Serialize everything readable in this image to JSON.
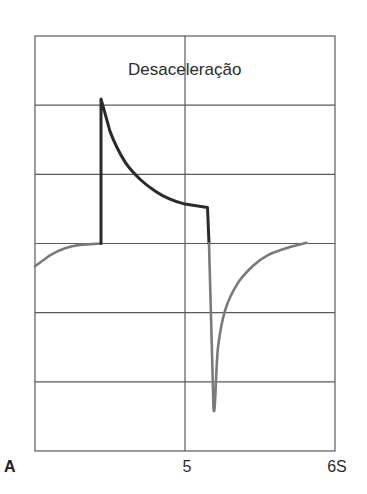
{
  "chart_data": {
    "type": "line",
    "title": "Desaceleração",
    "panel_label": "A",
    "xlabel": "",
    "ylabel": "",
    "x_unit": "S",
    "xlim": [
      4,
      6
    ],
    "x_ticks": [
      {
        "value": 5,
        "label": "5"
      },
      {
        "value": 6,
        "label": "6S"
      }
    ],
    "ylim": [
      -3,
      3
    ],
    "y_ticks": [],
    "grid": true,
    "grid_rows": 6,
    "grid_cols": 2,
    "baseline": 0,
    "series": [
      {
        "name": "pre-baseline (gray)",
        "color": "#7a7a7a",
        "points": [
          [
            4.0,
            -0.33
          ],
          [
            4.1,
            -0.17
          ],
          [
            4.2,
            -0.07
          ],
          [
            4.3,
            -0.02
          ],
          [
            4.44,
            0.0
          ]
        ]
      },
      {
        "name": "deceleration (dark)",
        "color": "#2a2a2a",
        "points": [
          [
            4.44,
            0.0
          ],
          [
            4.44,
            2.09
          ],
          [
            4.5,
            1.62
          ],
          [
            4.6,
            1.18
          ],
          [
            4.7,
            0.93
          ],
          [
            4.8,
            0.76
          ],
          [
            4.9,
            0.64
          ],
          [
            5.0,
            0.57
          ],
          [
            5.15,
            0.52
          ],
          [
            5.16,
            0.0
          ]
        ]
      },
      {
        "name": "post-deceleration (gray)",
        "color": "#7a7a7a",
        "points": [
          [
            5.16,
            0.0
          ],
          [
            5.19,
            -2.38
          ],
          [
            5.22,
            -1.5
          ],
          [
            5.27,
            -0.95
          ],
          [
            5.35,
            -0.58
          ],
          [
            5.45,
            -0.33
          ],
          [
            5.55,
            -0.17
          ],
          [
            5.7,
            -0.05
          ],
          [
            5.81,
            0.01
          ]
        ]
      }
    ],
    "annotations": []
  },
  "labels": {
    "title": "Desaceleração",
    "panel": "A",
    "tick_5": "5",
    "tick_6": "6S"
  }
}
